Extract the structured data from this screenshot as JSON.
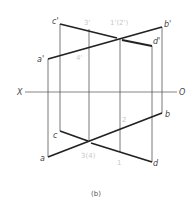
{
  "diagram": {
    "caption": "(b)",
    "axis": {
      "left_label": "X",
      "right_label": "O"
    },
    "upper_view": {
      "labels": {
        "c_prime": "c'",
        "b_prime": "b'",
        "a_prime": "a'",
        "d_prime": "d'",
        "three_prime": "3'",
        "four_prime": "4'",
        "one_two_prime": "1'(2')"
      }
    },
    "lower_view": {
      "labels": {
        "c": "c",
        "b": "b",
        "a": "a",
        "d": "d",
        "two": "2",
        "three_four": "3(4)",
        "one": "1"
      }
    },
    "colors": {
      "thick_line": "#222222",
      "thin_line": "#555555",
      "light_label": "#c8c8c8"
    }
  }
}
